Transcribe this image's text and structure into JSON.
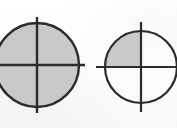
{
  "image": {
    "kind": "fraction-circle-diagram",
    "width": 177,
    "height": 128,
    "background_color": "#fdfdfc",
    "ink_color": "#2b2b2b",
    "shade_color": "#c9c9c9",
    "description": "Two circles each divided into four quadrants by a vertical and a horizontal diameter; the left circle has all four quadrants shaded, the right circle has only its upper-left quadrant shaded."
  },
  "figures": [
    {
      "id": "left-circle",
      "label": "Left fraction circle",
      "fraction_text": "4/4",
      "shaded_parts": 4,
      "total_parts": 4,
      "center_x": 37,
      "center_y": 65,
      "radius": 42,
      "outline_width": 2.4,
      "divider_width": 2.4,
      "divider_overhang": 6,
      "cropped_edge": "left",
      "quadrants": [
        {
          "name": "top-left",
          "shaded": true
        },
        {
          "name": "top-right",
          "shaded": true
        },
        {
          "name": "bottom-right",
          "shaded": true
        },
        {
          "name": "bottom-left",
          "shaded": true
        }
      ]
    },
    {
      "id": "right-circle",
      "label": "Right fraction circle",
      "fraction_text": "1/4",
      "shaded_parts": 1,
      "total_parts": 4,
      "center_x": 141,
      "center_y": 67,
      "radius": 36,
      "outline_width": 2.2,
      "divider_width": 2.2,
      "divider_overhang": 9,
      "cropped_edge": "right",
      "quadrants": [
        {
          "name": "top-left",
          "shaded": true
        },
        {
          "name": "top-right",
          "shaded": false
        },
        {
          "name": "bottom-right",
          "shaded": false
        },
        {
          "name": "bottom-left",
          "shaded": false
        }
      ]
    }
  ],
  "captions": []
}
